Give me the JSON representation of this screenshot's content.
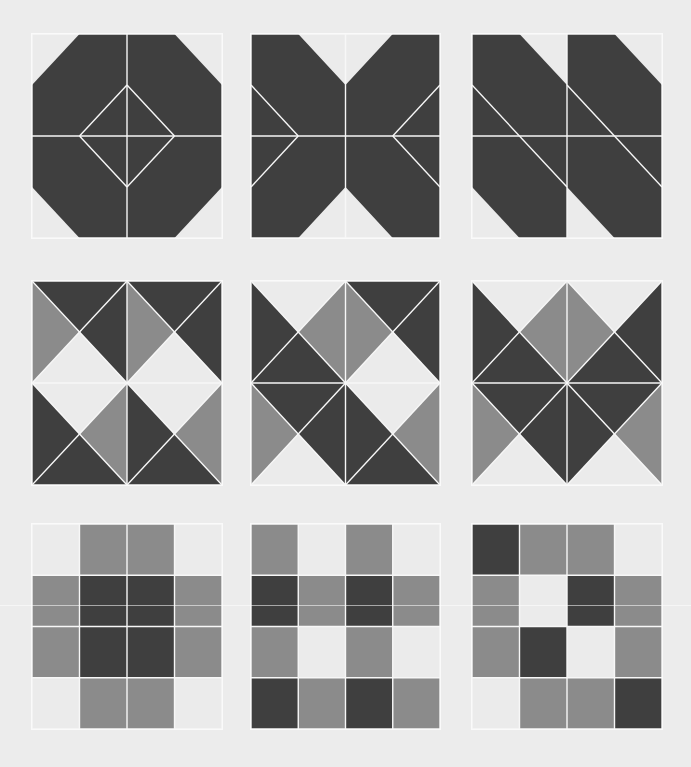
{
  "title": "Geometric quilt block patterns",
  "colors": {
    "dark": "#3f3f3f",
    "mid": "#8b8b8b",
    "light": "#ebebeb",
    "line": "#f7f7f7",
    "background": "#ececec"
  },
  "panels": [
    {
      "name": "octagon-diamond-block",
      "box": [
        32,
        34,
        190,
        204
      ],
      "shapes": [
        {
          "c": "dark",
          "pts": "0.25,0 0.75,0 1,0.25 1,0.75 0.75,1 0.25,1 0,0.75 0,0.25"
        }
      ],
      "lines": [
        "0.5,0 0.5,1",
        "0,0.5 1,0.5",
        "0.5,0.25 0.75,0.5",
        "0.75,0.5 0.5,0.75",
        "0.5,0.75 0.25,0.5",
        "0.25,0.5 0.5,0.25",
        "0,0 1,0",
        "1,0 1,1",
        "1,1 0,1",
        "0,1 0,0"
      ]
    },
    {
      "name": "hourglass-x-block",
      "box": [
        251,
        34,
        189,
        204
      ],
      "shapes": [
        {
          "c": "dark",
          "pts": "0,0 0.25,0 0.5,0.25 0.75,0 1,0 1,1 0.75,1 0.5,0.75 0.25,1 0,1"
        }
      ],
      "lines": [
        "0.5,0 0.5,1",
        "0,0.5 1,0.5",
        "0,0.25 0.25,0.5",
        "0.25,0.5 0,0.75",
        "1,0.25 0.75,0.5",
        "0.75,0.5 1,0.75",
        "0,0 1,0",
        "1,0 1,1",
        "1,1 0,1",
        "0,1 0,0"
      ]
    },
    {
      "name": "diagonal-stripe-block",
      "box": [
        472,
        34,
        190,
        204
      ],
      "shapes": [
        {
          "c": "dark",
          "pts": "0,0 0.25,0 0.5,0.25 0.5,1 0.25,1 0,0.75"
        },
        {
          "c": "dark",
          "pts": "0.5,0 0.75,0 1,0.25 1,1 0.75,1 0.5,0.75"
        }
      ],
      "lines": [
        "0.5,0 0.5,1",
        "0,0.5 1,0.5",
        "0,0.25 0.5,0.75",
        "0.5,0.25 1,0.75",
        "0,0 1,0",
        "1,0 1,1",
        "1,1 0,1",
        "0,1 0,0"
      ]
    },
    {
      "name": "pinwheel-hourglass-block",
      "box": [
        32,
        281,
        190,
        204
      ],
      "quads": [
        [
          "dark",
          "dark",
          "light",
          "mid"
        ],
        [
          "dark",
          "dark",
          "light",
          "mid"
        ],
        [
          "light",
          "mid",
          "dark",
          "dark"
        ],
        [
          "light",
          "mid",
          "dark",
          "dark"
        ]
      ]
    },
    {
      "name": "mixed-hourglass-block",
      "box": [
        251,
        281,
        189,
        204
      ],
      "quads": [
        [
          "light",
          "mid",
          "dark",
          "dark"
        ],
        [
          "dark",
          "dark",
          "light",
          "mid"
        ],
        [
          "dark",
          "dark",
          "light",
          "mid"
        ],
        [
          "light",
          "mid",
          "dark",
          "dark"
        ]
      ]
    },
    {
      "name": "star-hourglass-block",
      "box": [
        472,
        281,
        190,
        204
      ],
      "quads": [
        [
          "light",
          "mid",
          "dark",
          "dark"
        ],
        [
          "light",
          "dark",
          "dark",
          "mid"
        ],
        [
          "dark",
          "dark",
          "light",
          "mid"
        ],
        [
          "dark",
          "mid",
          "light",
          "dark"
        ]
      ]
    },
    {
      "name": "cross-grid-block",
      "box": [
        32,
        524,
        190,
        205
      ],
      "grid": [
        [
          "light",
          "mid",
          "mid",
          "light"
        ],
        [
          "mid",
          "dark",
          "dark",
          "mid"
        ],
        [
          "mid",
          "dark",
          "dark",
          "mid"
        ],
        [
          "light",
          "mid",
          "mid",
          "light"
        ]
      ]
    },
    {
      "name": "checker-grid-block",
      "box": [
        251,
        524,
        189,
        205
      ],
      "grid": [
        [
          "mid",
          "light",
          "mid",
          "light"
        ],
        [
          "dark",
          "mid",
          "dark",
          "mid"
        ],
        [
          "mid",
          "light",
          "mid",
          "light"
        ],
        [
          "dark",
          "mid",
          "dark",
          "mid"
        ]
      ]
    },
    {
      "name": "diagonal-grid-block",
      "box": [
        472,
        524,
        190,
        205
      ],
      "grid": [
        [
          "dark",
          "mid",
          "mid",
          "light"
        ],
        [
          "mid",
          "light",
          "dark",
          "mid"
        ],
        [
          "mid",
          "dark",
          "light",
          "mid"
        ],
        [
          "light",
          "mid",
          "mid",
          "dark"
        ]
      ]
    }
  ],
  "artifact_lines_y": [
    605
  ]
}
